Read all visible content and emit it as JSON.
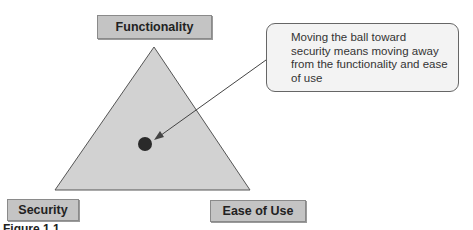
{
  "diagram": {
    "type": "triangle-tradeoff",
    "vertices": {
      "top": "Functionality",
      "bottom_left": "Security",
      "bottom_right": "Ease of Use"
    },
    "callout_text": "Moving the ball toward security means moving away from the functionality and ease of use",
    "caption": "Figure 1.1",
    "colors": {
      "triangle_fill": "#d2d2d2",
      "triangle_stroke": "#555555",
      "ball": "#2a2a2a",
      "label_fill": "#c4c4c4",
      "callout_fill": "#f3f3f3"
    }
  }
}
